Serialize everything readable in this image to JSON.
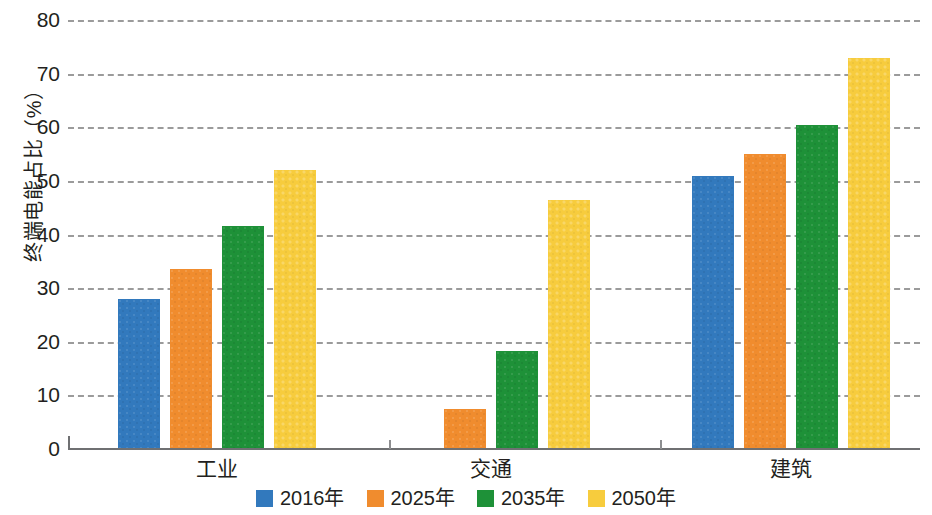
{
  "chart_data": {
    "type": "bar",
    "title": "",
    "subtitle": "",
    "xlabel": "",
    "ylabel": "终端电能占比（%）",
    "ylim": [
      0,
      80
    ],
    "y_ticks": [
      0,
      10,
      20,
      30,
      40,
      50,
      60,
      70,
      80
    ],
    "y_tick_labels": [
      "0",
      "10",
      "20",
      "30",
      "40",
      "50",
      "60",
      "70",
      "80"
    ],
    "grid": "horizontal-dashed",
    "legend_position": "bottom-center",
    "categories": [
      "工业",
      "交通",
      "建筑"
    ],
    "series": [
      {
        "name": "2016年",
        "color": "#3279bd",
        "values": [
          28.0,
          0.0,
          51.0
        ]
      },
      {
        "name": "2025年",
        "color": "#f08c2e",
        "values": [
          33.5,
          7.5,
          55.0
        ]
      },
      {
        "name": "2035年",
        "color": "#1e9138",
        "values": [
          41.5,
          18.3,
          60.5
        ]
      },
      {
        "name": "2050年",
        "color": "#f7cc3d",
        "values": [
          52.0,
          46.5,
          73.0
        ]
      }
    ]
  },
  "axis": {
    "y_title": "终端电能占比（%）",
    "ticks": [
      "0",
      "10",
      "20",
      "30",
      "40",
      "50",
      "60",
      "70",
      "80"
    ]
  },
  "categories": {
    "c0": "工业",
    "c1": "交通",
    "c2": "建筑"
  },
  "legend": {
    "items": [
      {
        "label": "2016年",
        "color": "#3279bd"
      },
      {
        "label": "2025年",
        "color": "#f08c2e"
      },
      {
        "label": "2035年",
        "color": "#1e9138"
      },
      {
        "label": "2050年",
        "color": "#f7cc3d"
      }
    ]
  },
  "colors": {
    "series_2016": "#3279bd",
    "series_2025": "#f08c2e",
    "series_2035": "#1e9138",
    "series_2050": "#f7cc3d",
    "gridline": "#8a8a8a",
    "axis": "#6f7072",
    "text": "#231f20",
    "background": "#ffffff"
  }
}
